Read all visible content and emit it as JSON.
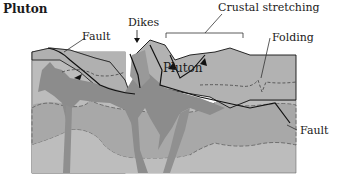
{
  "title": "Pluton",
  "labels": {
    "dikes": "Dikes",
    "crustal_stretching": "Crustal stretching",
    "fault_left": "Fault",
    "folding": "Folding",
    "pluton": "Pluton",
    "fault_right": "Fault"
  },
  "colors": {
    "light_layer": "#c0c0c0",
    "medium_layer": "#a9a9a9",
    "pluton": "#8c8c8c",
    "line": "#111111"
  }
}
